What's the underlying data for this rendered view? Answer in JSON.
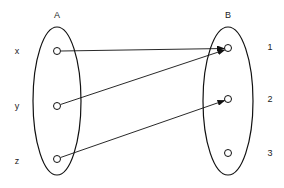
{
  "diagram": {
    "type": "function-mapping",
    "sets": [
      {
        "name": "A",
        "elements": [
          "x",
          "y",
          "z"
        ]
      },
      {
        "name": "B",
        "elements": [
          "1",
          "2",
          "3"
        ]
      }
    ],
    "labels": {
      "set_a": "A",
      "set_b": "B",
      "a_x": "x",
      "a_y": "y",
      "a_z": "z",
      "b_1": "1",
      "b_2": "2",
      "b_3": "3"
    },
    "mappings": [
      {
        "from": "x",
        "to": "1"
      },
      {
        "from": "y",
        "to": "1"
      },
      {
        "from": "z",
        "to": "2"
      }
    ],
    "colors": {
      "stroke": "#111111",
      "background": "#ffffff"
    }
  }
}
